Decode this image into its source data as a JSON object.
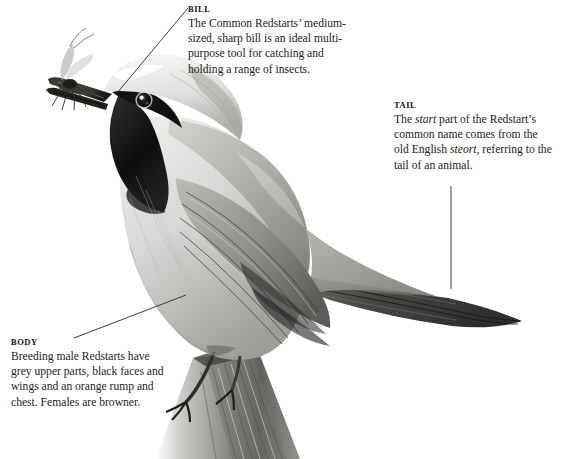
{
  "figure": {
    "subject": "Common Redstart",
    "medium": "pencil-illustration",
    "background_color": "#ffffff",
    "ink_color": "#1c1c1c"
  },
  "callouts": [
    {
      "id": "bill",
      "heading": "BILL",
      "body_html": "The Common Redstarts&#8217; medium-sized, sharp bill is an ideal multi-purpose tool for catching and holding a range of insects.",
      "body_plain": "The Common Redstarts' medium-sized, sharp bill is an ideal multi-purpose tool for catching and holding a range of insects.",
      "leader": {
        "from": [
          188,
          8
        ],
        "to": [
          117,
          93
        ]
      }
    },
    {
      "id": "tail",
      "heading": "TAIL",
      "body_html": "The <i>start</i> part of the Redstart&#8217;s common name comes from the old English <i>steort</i>, referring to the tail of an animal.",
      "body_plain": "The start part of the Redstart's common name comes from the old English steort, referring to the tail of an animal.",
      "leader": {
        "from": [
          451,
          186
        ],
        "to": [
          451,
          289
        ]
      }
    },
    {
      "id": "body",
      "heading": "BODY",
      "body_html": "Breeding male Redstarts have grey upper parts, black faces and wings and an orange rump and chest. Females are browner.",
      "body_plain": "Breeding male Redstarts have grey upper parts, black faces and wings and an orange rump and chest. Females are browner.",
      "leader": {
        "from": [
          74,
          338
        ],
        "to": [
          186,
          295
        ]
      }
    }
  ],
  "illustration_parts": [
    {
      "name": "insect-prey",
      "description": "winged insect held crosswise in the bill"
    },
    {
      "name": "bill",
      "description": "sharp pointed dark bill"
    },
    {
      "name": "head",
      "description": "white forehead stripe over black face mask"
    },
    {
      "name": "eye",
      "description": "dark round eye with pale highlight ring"
    },
    {
      "name": "throat",
      "description": "black throat patch"
    },
    {
      "name": "breast",
      "description": "pale grey shaded breast"
    },
    {
      "name": "wing",
      "description": "layered grey flight feathers with dark shafts"
    },
    {
      "name": "tail",
      "description": "long dark tail angled down to the right"
    },
    {
      "name": "legs",
      "description": "slender legs gripping the perch"
    },
    {
      "name": "perch",
      "description": "weathered wooden post"
    }
  ]
}
